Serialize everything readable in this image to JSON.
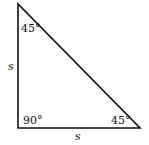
{
  "diagram": {
    "type": "right-isosceles-triangle",
    "angles": {
      "top": "45°",
      "bottom_left": "90°",
      "bottom_right": "45°"
    },
    "sides": {
      "left": "s",
      "bottom": "s"
    },
    "colors": {
      "stroke": "#111111",
      "background": "#ffffff"
    }
  }
}
